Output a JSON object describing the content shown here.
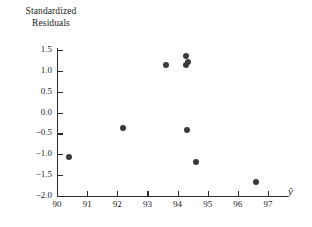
{
  "chart_data": {
    "type": "scatter",
    "title": "",
    "ylabel": "Standardized Residuals",
    "ylabel_line1": "Standardized",
    "ylabel_line2": "Residuals",
    "xlabel": "ŷ",
    "xlim": [
      90,
      97.67
    ],
    "ylim": [
      -2.0,
      1.75
    ],
    "grid": false,
    "legend": null,
    "xticks": [
      90,
      91,
      92,
      93,
      94,
      95,
      96,
      97
    ],
    "xtick_labels": [
      "90",
      "91",
      "92",
      "93",
      "94",
      "95",
      "96",
      "97"
    ],
    "yticks": [
      1.5,
      1.0,
      0.5,
      0.0,
      -0.5,
      -1.0,
      -1.5,
      -2.0
    ],
    "ytick_labels": [
      "1.5",
      "1.0",
      "0.5",
      "0.0",
      "−0.5",
      "−1.0",
      "−1.5",
      "−2.0"
    ],
    "marker": "filled-circle",
    "marker_color": "#3b3b3b",
    "points": [
      {
        "x": 90.4,
        "y": -1.07
      },
      {
        "x": 92.2,
        "y": -0.37
      },
      {
        "x": 93.62,
        "y": 1.14
      },
      {
        "x": 94.28,
        "y": 1.35
      },
      {
        "x": 94.36,
        "y": 1.2
      },
      {
        "x": 94.28,
        "y": 1.13
      },
      {
        "x": 94.3,
        "y": -0.42
      },
      {
        "x": 94.62,
        "y": -1.19
      },
      {
        "x": 96.6,
        "y": -1.67
      }
    ]
  }
}
